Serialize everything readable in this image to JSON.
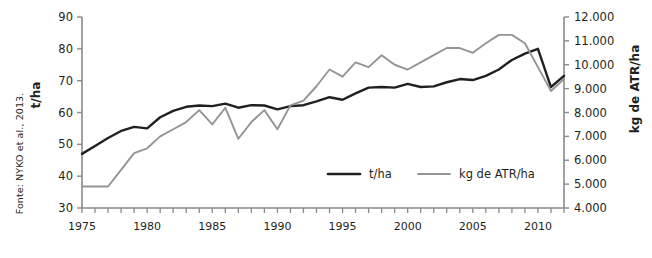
{
  "source_note": "Fonte: NYKO et al., 2013.",
  "axis": {
    "left_title": "t/ha",
    "right_title": "kg de ATR/ha"
  },
  "legend": {
    "items": [
      {
        "label": "t/ha",
        "color": "#231f20"
      },
      {
        "label": "kg de ATR/ha",
        "color": "#949494"
      }
    ]
  },
  "chart_data": {
    "type": "line",
    "title": "",
    "xlabel": "",
    "ylabel": "t/ha",
    "y2label": "kg de ATR/ha",
    "ylim": [
      30,
      90
    ],
    "y2lim": [
      4000,
      12000
    ],
    "xlim": [
      1975,
      2012
    ],
    "grid": false,
    "legend_position": "bottom-center",
    "y_ticks": [
      "30",
      "40",
      "50",
      "60",
      "70",
      "80",
      "90"
    ],
    "y2_ticks": [
      "4.000",
      "5.000",
      "6.000",
      "7.000",
      "8.000",
      "9.000",
      "10.000",
      "11.000",
      "12.000"
    ],
    "x_ticks": [
      "1975",
      "1980",
      "1985",
      "1990",
      "1995",
      "2000",
      "2005",
      "2010"
    ],
    "x": [
      1975,
      1976,
      1977,
      1978,
      1979,
      1980,
      1981,
      1982,
      1983,
      1984,
      1985,
      1986,
      1987,
      1988,
      1989,
      1990,
      1991,
      1992,
      1993,
      1994,
      1995,
      1996,
      1997,
      1998,
      1999,
      2000,
      2001,
      2002,
      2003,
      2004,
      2005,
      2006,
      2007,
      2008,
      2009,
      2010,
      2011,
      2012
    ],
    "series": [
      {
        "name": "t/ha",
        "color": "#231f20",
        "axis": "left",
        "values": [
          47.0,
          49.5,
          52.0,
          54.2,
          55.5,
          55.0,
          58.5,
          60.5,
          61.8,
          62.2,
          62.0,
          62.8,
          61.5,
          62.3,
          62.2,
          61.0,
          62.0,
          62.3,
          63.5,
          64.8,
          64.0,
          66.0,
          67.8,
          68.0,
          67.8,
          69.0,
          68.0,
          68.2,
          69.5,
          70.5,
          70.2,
          71.5,
          73.5,
          76.5,
          78.5,
          80.0,
          68.0,
          71.5
        ]
      },
      {
        "name": "kg de ATR/ha",
        "color": "#949494",
        "axis": "right",
        "values": [
          4900,
          4900,
          4900,
          5600,
          6300,
          6500,
          7000,
          7300,
          7600,
          8100,
          7500,
          8200,
          6900,
          7600,
          8100,
          7300,
          8300,
          8500,
          9100,
          9800,
          9500,
          10100,
          9900,
          10400,
          10000,
          9800,
          10100,
          10400,
          10700,
          10700,
          10500,
          10900,
          11250,
          11250,
          10900,
          9900,
          8900,
          9400
        ]
      }
    ]
  }
}
